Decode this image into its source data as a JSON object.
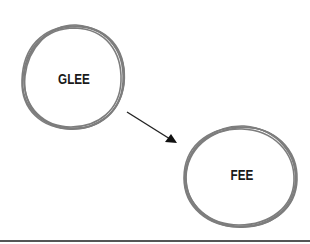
{
  "diagram": {
    "nodes": [
      {
        "id": "glee",
        "label": "GLEE"
      },
      {
        "id": "fee",
        "label": "FEE"
      }
    ],
    "edges": [
      {
        "from": "glee",
        "to": "fee",
        "type": "directed-arrow"
      }
    ],
    "colors": {
      "circle_stroke": "#7a7a7a",
      "arrow": "#222222",
      "text": "#1a1a1a",
      "baseline": "#555555"
    }
  }
}
